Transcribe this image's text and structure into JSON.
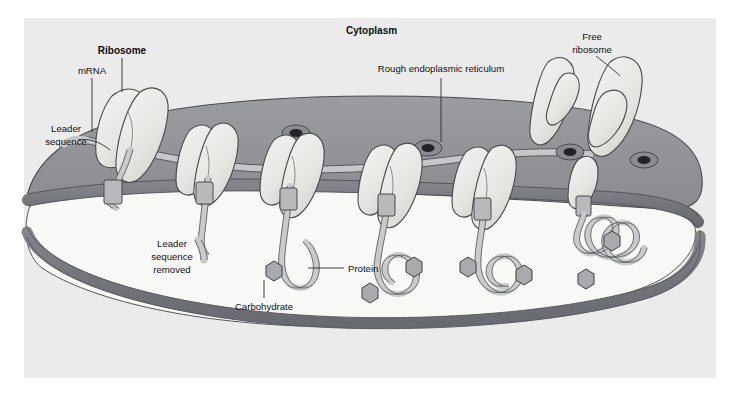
{
  "figure": {
    "kind": "biology-diagram",
    "frame_background": "#ffffff",
    "plate_background": "#ececed"
  },
  "palette": {
    "page_white": "#ffffff",
    "plate_gray": "#ebebec",
    "cytoplasm_gray": "#8f9094",
    "cytoplasm_gray_light": "#9b9ca0",
    "membrane_band": "#7a7b80",
    "membrane_band_dark": "#6d6e73",
    "lumen_white": "#f7f7f5",
    "ribosome_fill": "#e8e8e6",
    "ribosome_shade": "#d2d2cf",
    "ribosome_stroke": "#4a4a4c",
    "strand_fill": "#c9cacb",
    "strand_stroke": "#4e4f52",
    "carb_fill": "#a9aaad",
    "carb_stroke": "#3d3e40",
    "pore_outer": "#7d7e83",
    "pore_inner": "#2a2a2c",
    "outline": "#3c3d3f",
    "label_text": "#111111"
  },
  "labels": {
    "cytoplasm": "Cytoplasm",
    "ribosome": "Ribosome",
    "mrna": "mRNA",
    "leader_sequence_l1": "Leader",
    "leader_sequence_l2": "sequence",
    "rough_er": "Rough endoplasmic reticulum",
    "free_ribosome_l1": "Free",
    "free_ribosome_l2": "ribosome",
    "leader_removed_l1": "Leader",
    "leader_removed_l2": "sequence",
    "leader_removed_l3": "removed",
    "protein": "Protein",
    "carbohydrate": "Carbohydrate"
  },
  "structures": {
    "bound_ribosome_count": 6,
    "free_ribosome_count": 2,
    "surface_pore_count": 4,
    "carbohydrate_count": 6,
    "compartments": [
      "cytoplasm",
      "er-membrane",
      "er-lumen"
    ]
  }
}
